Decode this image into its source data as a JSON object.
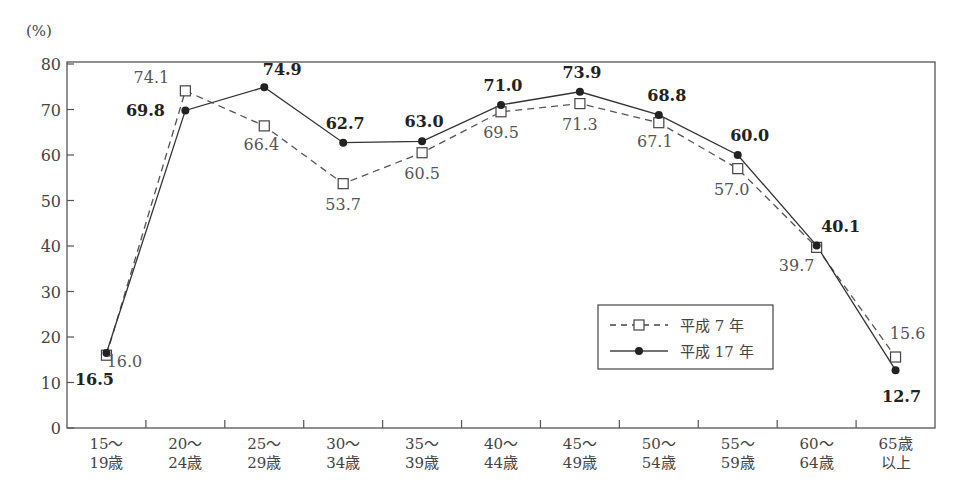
{
  "chart_data": {
    "type": "line",
    "title": "",
    "ylabel": "(%)",
    "xlabel": "",
    "ylim": [
      0,
      80
    ],
    "yticks": [
      0,
      10,
      20,
      30,
      40,
      50,
      60,
      70,
      80
    ],
    "grid": false,
    "legend_position": "inside-lower-right",
    "categories": [
      [
        "15〜",
        "19歳"
      ],
      [
        "20〜",
        "24歳"
      ],
      [
        "25〜",
        "29歳"
      ],
      [
        "30〜",
        "34歳"
      ],
      [
        "35〜",
        "39歳"
      ],
      [
        "40〜",
        "44歳"
      ],
      [
        "45〜",
        "49歳"
      ],
      [
        "50〜",
        "54歳"
      ],
      [
        "55〜",
        "59歳"
      ],
      [
        "60〜",
        "64歳"
      ],
      [
        "65歳",
        "以上"
      ]
    ],
    "series": [
      {
        "name": "平成 7 年",
        "style": "dashed",
        "marker": "open-square",
        "values": [
          16.0,
          74.1,
          66.4,
          53.7,
          60.5,
          69.5,
          71.3,
          67.1,
          57.0,
          39.7,
          15.6
        ],
        "label_offsets": [
          [
            18,
            12
          ],
          [
            -34,
            -8
          ],
          [
            -3,
            24
          ],
          [
            0,
            26
          ],
          [
            0,
            26
          ],
          [
            0,
            26
          ],
          [
            0,
            26
          ],
          [
            -4,
            24
          ],
          [
            -6,
            26
          ],
          [
            -20,
            24
          ],
          [
            12,
            -18
          ]
        ]
      },
      {
        "name": "平成 17 年",
        "style": "solid",
        "marker": "filled-circle",
        "values": [
          16.5,
          69.8,
          74.9,
          62.7,
          63.0,
          71.0,
          73.9,
          68.8,
          60.0,
          40.1,
          12.7
        ],
        "label_offsets": [
          [
            -12,
            32
          ],
          [
            -40,
            6
          ],
          [
            18,
            -12
          ],
          [
            2,
            -14
          ],
          [
            2,
            -14
          ],
          [
            2,
            -14
          ],
          [
            2,
            -14
          ],
          [
            8,
            -14
          ],
          [
            12,
            -14
          ],
          [
            24,
            -14
          ],
          [
            6,
            32
          ]
        ]
      }
    ]
  }
}
